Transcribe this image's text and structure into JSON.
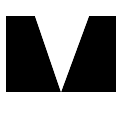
{
  "figure": {
    "type": "geometry-diagram",
    "points": {
      "P": {
        "label": "P"
      },
      "Q": {
        "label": "Q"
      },
      "R": {
        "label": "R"
      },
      "S": {
        "label": "S"
      },
      "T": {
        "label": "T"
      },
      "U": {
        "label": "U"
      },
      "V": {
        "label": "V"
      }
    },
    "rectangle": [
      "P",
      "Q",
      "R",
      "S"
    ],
    "unshaded_triangle": [
      "T",
      "U",
      "V"
    ],
    "relations": {
      "T_on": "PQ",
      "U_on": "PQ",
      "V_on": "SR"
    },
    "colors": {
      "shade": "#6e6e6e",
      "stroke": "#2a2a2a",
      "background": "#ffffff",
      "label": "#222222"
    }
  }
}
